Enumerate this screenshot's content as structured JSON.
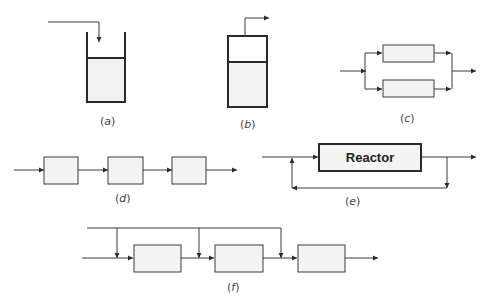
{
  "figure": {
    "panels": [
      {
        "id": "a",
        "label": "a",
        "type": "batch-tank",
        "description": "Tank with feed pipe entering from top"
      },
      {
        "id": "b",
        "label": "b",
        "type": "closed-vessel",
        "description": "Closed vessel with vapor outlet on top"
      },
      {
        "id": "c",
        "label": "c",
        "type": "parallel-reactors",
        "units": 2
      },
      {
        "id": "d",
        "label": "d",
        "type": "series-reactors",
        "units": 3
      },
      {
        "id": "e",
        "label": "e",
        "type": "reactor-with-recycle",
        "reactor_label": "Reactor"
      },
      {
        "id": "f",
        "label": "f",
        "type": "series-with-split-feed",
        "units": 3,
        "side_feeds": 3
      }
    ],
    "colors": {
      "stroke": "#3a3a3a",
      "fill": "#f4f4f4",
      "background": "#ffffff"
    }
  }
}
